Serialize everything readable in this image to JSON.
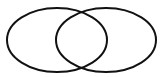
{
  "diagram": {
    "type": "venn",
    "sets": [
      {
        "name": "set-a",
        "label": ""
      },
      {
        "name": "set-b",
        "label": ""
      }
    ],
    "colors": {
      "background": "#ffffff",
      "stroke": "#111111"
    }
  }
}
